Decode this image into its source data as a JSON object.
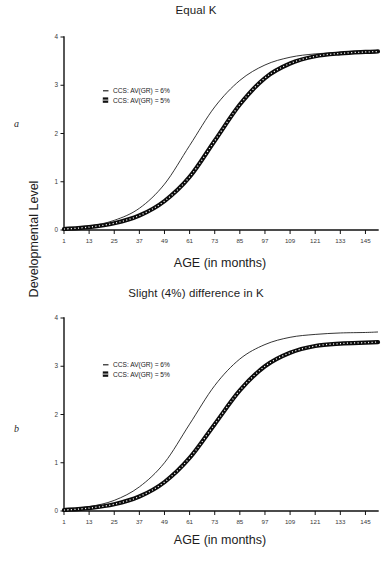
{
  "figure": {
    "y_axis_label": "Developmental Level",
    "panels": [
      {
        "letter": "a",
        "title": "Equal K",
        "x_axis_label": "AGE (in months)"
      },
      {
        "letter": "b",
        "title": "Slight (4%) difference in K",
        "x_axis_label": "AGE (in months)"
      }
    ]
  },
  "chart_data": [
    {
      "type": "line",
      "title": "Equal K",
      "xlabel": "AGE (in months)",
      "ylabel": "Developmental Level",
      "xlim": [
        1,
        151
      ],
      "ylim": [
        0,
        4
      ],
      "xticks": [
        1,
        13,
        25,
        37,
        49,
        61,
        73,
        85,
        97,
        109,
        121,
        133,
        145
      ],
      "yticks": [
        0,
        1,
        2,
        3,
        4
      ],
      "grid": false,
      "legend_position": "upper-left-inside",
      "series": [
        {
          "name": "CCS: AV(GR) = 6%",
          "marker": "line",
          "style": "thin-solid-line",
          "x": [
            1,
            13,
            25,
            37,
            49,
            61,
            73,
            85,
            97,
            109,
            121,
            133,
            145,
            151
          ],
          "values": [
            0.03,
            0.08,
            0.2,
            0.45,
            0.95,
            1.75,
            2.55,
            3.1,
            3.42,
            3.58,
            3.65,
            3.68,
            3.7,
            3.7
          ]
        },
        {
          "name": "CCS: AV(GR) = 5%",
          "marker": "square",
          "style": "thick-dotted-band",
          "x": [
            1,
            13,
            25,
            37,
            49,
            61,
            73,
            85,
            97,
            109,
            121,
            133,
            145,
            151
          ],
          "values": [
            0.02,
            0.06,
            0.14,
            0.3,
            0.6,
            1.1,
            1.85,
            2.6,
            3.15,
            3.45,
            3.6,
            3.66,
            3.69,
            3.7
          ]
        }
      ]
    },
    {
      "type": "line",
      "title": "Slight (4%) difference in K",
      "xlabel": "AGE (in months)",
      "ylabel": "Developmental Level",
      "xlim": [
        1,
        151
      ],
      "ylim": [
        0,
        4
      ],
      "xticks": [
        1,
        13,
        25,
        37,
        49,
        61,
        73,
        85,
        97,
        109,
        121,
        133,
        145
      ],
      "yticks": [
        0,
        1,
        2,
        3,
        4
      ],
      "grid": false,
      "legend_position": "upper-left-inside",
      "series": [
        {
          "name": "CCS: AV(GR) = 6%",
          "marker": "line",
          "style": "thin-solid-line",
          "x": [
            1,
            13,
            25,
            37,
            49,
            61,
            73,
            85,
            97,
            109,
            121,
            133,
            145,
            151
          ],
          "values": [
            0.03,
            0.09,
            0.22,
            0.5,
            1.0,
            1.8,
            2.6,
            3.15,
            3.45,
            3.6,
            3.66,
            3.69,
            3.7,
            3.71
          ]
        },
        {
          "name": "CCS: AV(GR) = 5%",
          "marker": "square",
          "style": "thick-dotted-band",
          "x": [
            1,
            13,
            25,
            37,
            49,
            61,
            73,
            85,
            97,
            109,
            121,
            133,
            145,
            151
          ],
          "values": [
            0.02,
            0.06,
            0.14,
            0.3,
            0.6,
            1.1,
            1.8,
            2.5,
            3.0,
            3.28,
            3.42,
            3.47,
            3.49,
            3.5
          ]
        }
      ]
    }
  ],
  "legend": {
    "entries": [
      {
        "marker_icon": "dash-icon",
        "label": "CCS: AV(GR) = 6%"
      },
      {
        "marker_icon": "square-marker-icon",
        "label": "CCS: AV(GR) = 5%"
      }
    ]
  },
  "ticks": {
    "x": [
      "1",
      "13",
      "25",
      "37",
      "49",
      "61",
      "73",
      "85",
      "97",
      "109",
      "121",
      "133",
      "145"
    ],
    "y": [
      "0",
      "1",
      "2",
      "3",
      "4"
    ]
  }
}
